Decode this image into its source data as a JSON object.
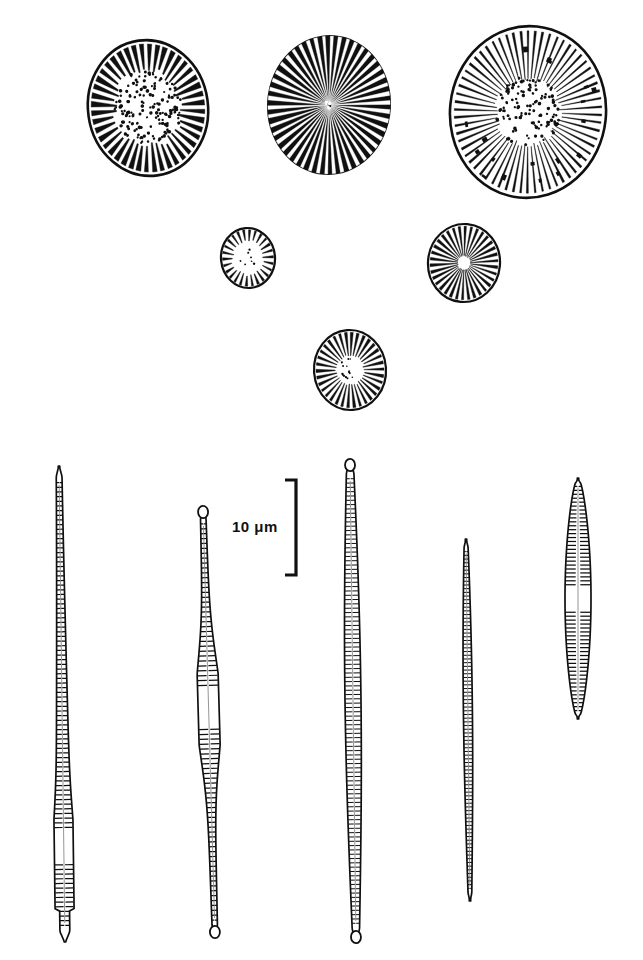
{
  "figure": {
    "background_color": "#ffffff",
    "ink_color": "#101010",
    "width": 643,
    "height": 960
  },
  "scale_bar": {
    "label": "10 μm",
    "label_x": 232,
    "label_y": 518,
    "bar_x": 296,
    "bar_top": 480,
    "bar_bottom": 575,
    "serif_width": 11,
    "orientation": "vertical",
    "bracket": true
  },
  "centric_valves": [
    {
      "name": "centric-valve-1",
      "cx": 148,
      "cy": 108,
      "rx": 60,
      "ry": 68,
      "rotation": -8,
      "style": "dark-marginal-rays",
      "ray_count": 44,
      "ray_inner_fraction": 0.56,
      "ray_width_deg": 4.6,
      "center_dots": 150,
      "center_dot_radius_fraction": 0.56,
      "marginal_spots": 0
    },
    {
      "name": "centric-valve-2",
      "cx": 329,
      "cy": 105,
      "rx": 62,
      "ry": 70,
      "rotation": 4,
      "style": "black-field-white-rays",
      "ray_count": 46,
      "ray_inner_fraction": 0.04,
      "ray_width_deg": 3.0,
      "center_dots": 6,
      "center_dot_radius_fraction": 0.06,
      "marginal_spots": 0
    },
    {
      "name": "centric-valve-3",
      "cx": 528,
      "cy": 112,
      "rx": 78,
      "ry": 86,
      "rotation": 6,
      "style": "light-thin-rays",
      "ray_count": 62,
      "ray_inner_fraction": 0.4,
      "ray_width_deg": 1.5,
      "center_dots": 120,
      "center_dot_radius_fraction": 0.42,
      "marginal_spots": 18
    },
    {
      "name": "centric-valve-4",
      "cx": 248,
      "cy": 258,
      "rx": 27,
      "ry": 30,
      "rotation": -5,
      "style": "short-marginal-dashes",
      "ray_count": 26,
      "ray_inner_fraction": 0.58,
      "ray_width_deg": 5.0,
      "center_dots": 7,
      "center_dot_radius_fraction": 0.3,
      "marginal_spots": 0
    },
    {
      "name": "centric-valve-5",
      "cx": 464,
      "cy": 263,
      "rx": 36,
      "ry": 39,
      "rotation": 5,
      "style": "full-radial-striae",
      "ray_count": 34,
      "ray_inner_fraction": 0.18,
      "ray_width_deg": 4.2,
      "center_dots": 0,
      "center_dot_radius_fraction": 0.16,
      "marginal_spots": 0
    },
    {
      "name": "centric-valve-6",
      "cx": 350,
      "cy": 370,
      "rx": 36,
      "ry": 40,
      "rotation": -4,
      "style": "radial-striae-dotted-center",
      "ray_count": 34,
      "ray_inner_fraction": 0.38,
      "ray_width_deg": 4.4,
      "center_dots": 14,
      "center_dot_radius_fraction": 0.3,
      "marginal_spots": 0
    }
  ],
  "pennate_valves": [
    {
      "name": "pennate-valve-1",
      "top_x": 59,
      "top_y": 466,
      "bottom_x": 65,
      "bottom_y": 942,
      "apex_top": "rounded",
      "apex_bottom": "blunt-foot",
      "max_half_width": 9.5,
      "stria_count": 96,
      "central_area": true,
      "central_area_position": 0.8,
      "central_area_length": 0.07,
      "swelling_position": 0.8,
      "profile": "needle-swollen-foot"
    },
    {
      "name": "pennate-valve-2",
      "top_x": 203,
      "top_y": 509,
      "bottom_x": 215,
      "bottom_y": 935,
      "apex_top": "capitate",
      "apex_bottom": "capitate",
      "max_half_width": 10.5,
      "stria_count": 82,
      "central_area": true,
      "central_area_position": 0.47,
      "central_area_length": 0.09,
      "swelling_position": 0.47,
      "profile": "capitate-both-ends-swollen-middle"
    },
    {
      "name": "pennate-valve-3",
      "top_x": 350,
      "top_y": 462,
      "bottom_x": 356,
      "bottom_y": 940,
      "apex_top": "capitate",
      "apex_bottom": "capitate",
      "max_half_width": 8.0,
      "stria_count": 104,
      "central_area": false,
      "central_area_position": 0.5,
      "central_area_length": 0.0,
      "swelling_position": 0.5,
      "profile": "long-linear-capitate"
    },
    {
      "name": "pennate-valve-4",
      "top_x": 466,
      "top_y": 539,
      "bottom_x": 470,
      "bottom_y": 901,
      "apex_top": "rounded",
      "apex_bottom": "rounded",
      "max_half_width": 4.5,
      "stria_count": 92,
      "central_area": false,
      "central_area_position": 0.5,
      "central_area_length": 0.0,
      "swelling_position": 0.5,
      "profile": "very-narrow-needle"
    },
    {
      "name": "pennate-valve-5",
      "top_x": 578,
      "top_y": 478,
      "bottom_x": 578,
      "bottom_y": 719,
      "apex_top": "rounded",
      "apex_bottom": "rounded",
      "max_half_width": 13.0,
      "stria_count": 58,
      "central_area": true,
      "central_area_position": 0.5,
      "central_area_length": 0.1,
      "swelling_position": 0.5,
      "profile": "lanceolate"
    }
  ]
}
